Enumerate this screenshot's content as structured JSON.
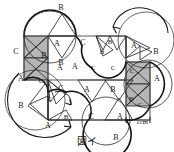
{
  "figure": {
    "caption": "図イ",
    "scale_label": "1cm",
    "colors": {
      "stroke": "#1a1a1a",
      "thin_stroke": "#2b2b2b",
      "shade_fill": "#b5b5b5",
      "background": "#ffffff",
      "polygon_edge": "#555555"
    },
    "vertex_labels": [
      {
        "text": "B",
        "x": 61,
        "y": 8
      },
      {
        "text": "A",
        "x": 57,
        "y": 44
      },
      {
        "text": "B",
        "x": 61,
        "y": 63
      },
      {
        "text": "C",
        "x": 16,
        "y": 52
      },
      {
        "text": "B",
        "x": 44,
        "y": 56
      },
      {
        "text": "A",
        "x": 21,
        "y": 79
      },
      {
        "text": "C",
        "x": 83,
        "y": 43
      },
      {
        "text": "A",
        "x": 60,
        "y": 68
      },
      {
        "text": "B",
        "x": 110,
        "y": 42
      },
      {
        "text": "B",
        "x": 102,
        "y": 52
      },
      {
        "text": "A",
        "x": 134,
        "y": 46
      },
      {
        "text": "B",
        "x": 156,
        "y": 52
      },
      {
        "text": "C",
        "x": 93,
        "y": 68
      },
      {
        "text": "A",
        "x": 88,
        "y": 67
      },
      {
        "text": "C",
        "x": 113,
        "y": 68
      },
      {
        "text": "C",
        "x": 132,
        "y": 71
      },
      {
        "text": "A",
        "x": 157,
        "y": 79
      },
      {
        "text": "B",
        "x": 131,
        "y": 99
      },
      {
        "text": "C",
        "x": 140,
        "y": 105
      },
      {
        "text": "C",
        "x": 41,
        "y": 81
      },
      {
        "text": "C",
        "x": 61,
        "y": 89
      },
      {
        "text": "C",
        "x": 50,
        "y": 99
      },
      {
        "text": "A",
        "x": 87,
        "y": 90
      },
      {
        "text": "B",
        "x": 21,
        "y": 106
      },
      {
        "text": "B",
        "x": 66,
        "y": 117
      },
      {
        "text": "A",
        "x": 48,
        "y": 126
      },
      {
        "text": "C",
        "x": 91,
        "y": 117
      },
      {
        "text": "B",
        "x": 113,
        "y": 90
      },
      {
        "text": "A",
        "x": 120,
        "y": 117
      },
      {
        "text": "B",
        "x": 116,
        "y": 138
      }
    ]
  }
}
